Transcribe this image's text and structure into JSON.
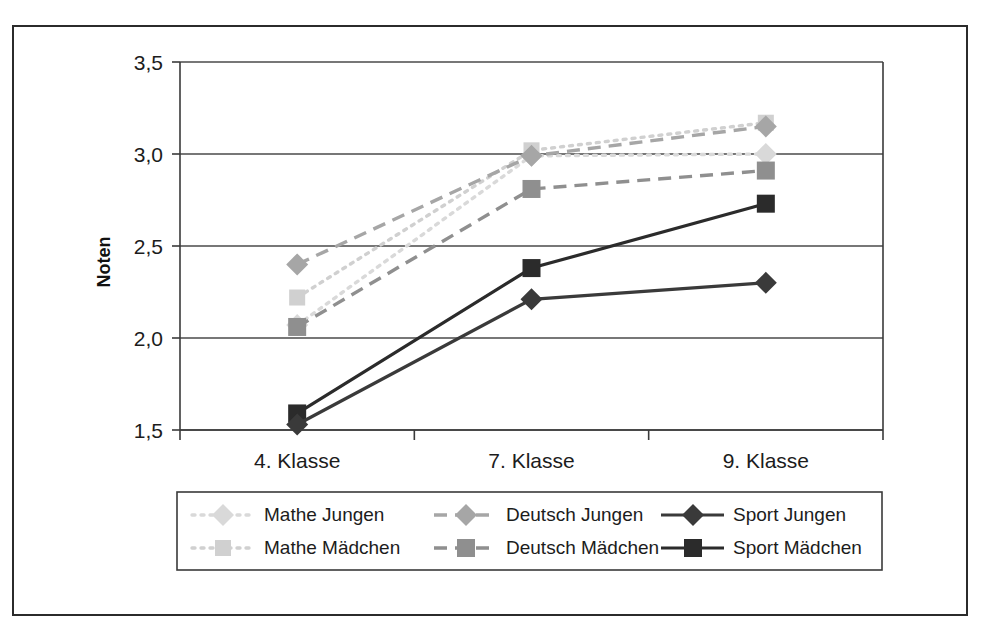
{
  "chart_data": {
    "type": "line",
    "title": "",
    "xlabel": "",
    "ylabel": "Noten",
    "categories": [
      "4. Klasse",
      "7. Klasse",
      "9. Klasse"
    ],
    "ylim": [
      1.5,
      3.5
    ],
    "yticks": [
      "1,5",
      "2,0",
      "2,5",
      "3,0",
      "3,5"
    ],
    "ytick_values": [
      1.5,
      2.0,
      2.5,
      3.0,
      3.5
    ],
    "grid": true,
    "legend_position": "bottom",
    "series": [
      {
        "name": "Mathe Jungen",
        "values": [
          2.07,
          2.99,
          3.0
        ],
        "color": "#d9d9d9",
        "marker": "diamond",
        "linestyle": "dotted"
      },
      {
        "name": "Mathe Mädchen",
        "values": [
          2.22,
          3.02,
          3.17
        ],
        "color": "#d0d0d0",
        "marker": "square",
        "linestyle": "dotted"
      },
      {
        "name": "Deutsch Jungen",
        "values": [
          2.4,
          2.99,
          3.15
        ],
        "color": "#a6a6a6",
        "marker": "diamond",
        "linestyle": "dashed"
      },
      {
        "name": "Deutsch Mädchen",
        "values": [
          2.06,
          2.81,
          2.91
        ],
        "color": "#8f8f8f",
        "marker": "square",
        "linestyle": "dashed"
      },
      {
        "name": "Sport Jungen",
        "values": [
          1.53,
          2.21,
          2.3
        ],
        "color": "#3a3a3a",
        "marker": "diamond",
        "linestyle": "solid"
      },
      {
        "name": "Sport Mädchen",
        "values": [
          1.59,
          2.38,
          2.73
        ],
        "color": "#2b2b2b",
        "marker": "square",
        "linestyle": "solid"
      }
    ]
  },
  "axis": {
    "y_title": "Noten",
    "ytick_0": "1,5",
    "ytick_1": "2,0",
    "ytick_2": "2,5",
    "ytick_3": "3,0",
    "ytick_4": "3,5",
    "xtick_0": "4. Klasse",
    "xtick_1": "7. Klasse",
    "xtick_2": "9. Klasse"
  },
  "legend": {
    "entries": [
      {
        "label": "Mathe Jungen"
      },
      {
        "label": "Deutsch Jungen"
      },
      {
        "label": "Sport Jungen"
      },
      {
        "label": "Mathe Mädchen"
      },
      {
        "label": "Deutsch Mädchen"
      },
      {
        "label": "Sport Mädchen"
      }
    ]
  }
}
